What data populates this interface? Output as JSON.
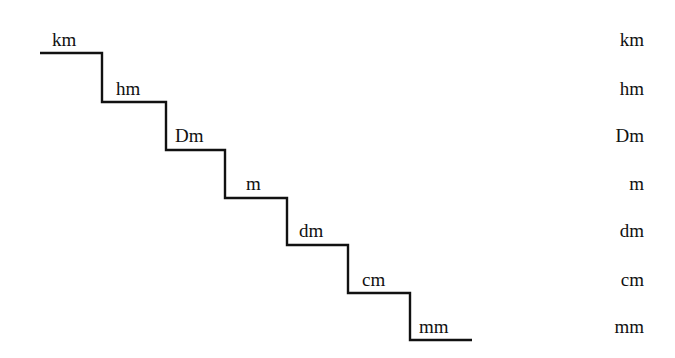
{
  "diagram": {
    "type": "metric-length-unit-staircase",
    "stairs": [
      {
        "label": "km"
      },
      {
        "label": "hm"
      },
      {
        "label": "Dm"
      },
      {
        "label": "m"
      },
      {
        "label": "dm"
      },
      {
        "label": "cm"
      },
      {
        "label": "mm"
      }
    ],
    "right_column": [
      {
        "label": "km"
      },
      {
        "label": "hm"
      },
      {
        "label": "Dm"
      },
      {
        "label": "m"
      },
      {
        "label": "dm"
      },
      {
        "label": "cm"
      },
      {
        "label": "mm"
      }
    ],
    "line_color": "#111111"
  }
}
